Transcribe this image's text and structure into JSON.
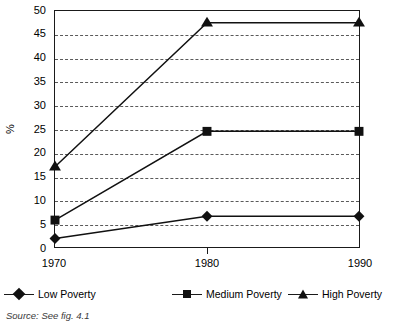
{
  "chart_data": {
    "type": "line",
    "title": "",
    "xlabel": "",
    "ylabel": "%",
    "categories": [
      "1970",
      "1980",
      "1990"
    ],
    "x": [
      1970,
      1980,
      1990
    ],
    "xlim": [
      1970,
      1990
    ],
    "ylim": [
      0,
      50
    ],
    "y_ticks": [
      0,
      5,
      10,
      15,
      20,
      25,
      30,
      35,
      40,
      45,
      50
    ],
    "y_tick_labels": [
      "0",
      "5",
      "10",
      "15",
      "20",
      "25",
      "30",
      "35",
      "40",
      "45",
      "50"
    ],
    "grid": "horizontal-dashed",
    "legend_position": "bottom",
    "series": [
      {
        "name": "Low Poverty",
        "marker": "diamond",
        "color": "#111111",
        "values": [
          1.8,
          6.5,
          6.5
        ]
      },
      {
        "name": "Medium Poverty",
        "marker": "square",
        "color": "#111111",
        "values": [
          5.7,
          24.5,
          24.5
        ]
      },
      {
        "name": "High Poverty",
        "marker": "triangle",
        "color": "#111111",
        "values": [
          17.0,
          47.5,
          47.5
        ]
      }
    ],
    "source_note": "Source: See fig. 4.1"
  },
  "axes": {
    "y_title": "%",
    "y_labels": [
      "50",
      "45",
      "40",
      "35",
      "30",
      "25",
      "20",
      "15",
      "10",
      "5",
      "0"
    ],
    "x_labels": [
      "1970",
      "1980",
      "1990"
    ]
  },
  "legend": {
    "items": [
      {
        "label": "Low Poverty",
        "marker": "diamond-marker-icon"
      },
      {
        "label": "Medium Poverty",
        "marker": "square-marker-icon"
      },
      {
        "label": "High Poverty",
        "marker": "triangle-marker-icon"
      }
    ]
  },
  "footer": {
    "source": "Source: See fig. 4.1"
  }
}
